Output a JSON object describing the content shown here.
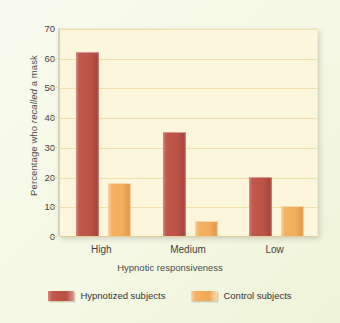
{
  "chart_data": {
    "type": "bar",
    "title": "",
    "subtitle": "",
    "categories": [
      "High",
      "Medium",
      "Low"
    ],
    "series": [
      {
        "name": "Hypnotized subjects",
        "color": "#bb5347",
        "values": [
          62,
          35,
          20
        ]
      },
      {
        "name": "Control subjects",
        "color": "#f2ad5c",
        "values": [
          18,
          5,
          10
        ]
      }
    ],
    "xlabel": "Hypnotic responsiveness",
    "ylabel_prefix": "Percentage who ",
    "ylabel_italic": "recalled",
    "ylabel_suffix": " a mask",
    "ylabel_full": "Percentage who recalled a mask",
    "yticks": [
      0,
      10,
      20,
      30,
      40,
      50,
      60,
      70
    ],
    "ylim": [
      0,
      70
    ],
    "grid": true,
    "legend_position": "bottom",
    "colors": {
      "plot_background": "#fcf6dc",
      "page_background": "#f7faea",
      "gridline": "#f0dfa8",
      "axis": "#d6d2bc",
      "series_red": "#bb5347",
      "series_orange": "#f2ad5c",
      "text": "#3f3f3f"
    }
  }
}
